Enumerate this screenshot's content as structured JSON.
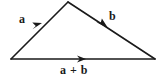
{
  "figure": {
    "name": "vector-addition-triangle",
    "background_color": "#ffffff",
    "stroke_color": "#1a1a1a",
    "labels": {
      "vector_a": "a",
      "vector_b": "b",
      "vector_sum": "a + b"
    }
  },
  "diagram_data": {
    "type": "vector-diagram",
    "description": "Triangle rule for vector addition: vector a from lower-left vertex to apex, vector b from apex to lower-right vertex, resultant a + b along the base from lower-left to lower-right.",
    "vertices": {
      "left": [
        11,
        59
      ],
      "apex": [
        68,
        2
      ],
      "right": [
        155,
        59
      ]
    },
    "vectors": [
      {
        "name": "a",
        "label": "a",
        "from": [
          11,
          59
        ],
        "to": [
          68,
          2
        ],
        "arrowhead_at": [
          38,
          27
        ],
        "label_position": [
          23,
          19
        ]
      },
      {
        "name": "b",
        "label": "b",
        "from": [
          68,
          2
        ],
        "to": [
          155,
          59
        ],
        "arrowhead_at": [
          104,
          25
        ],
        "label_position": [
          113,
          16
        ]
      },
      {
        "name": "a_plus_b",
        "label": "a + b",
        "from": [
          11,
          59
        ],
        "to": [
          155,
          59
        ],
        "arrowhead_at": [
          84,
          59
        ],
        "label_position": [
          78,
          70
        ]
      }
    ],
    "line_width": 1.6,
    "arrow_length": 9,
    "arrow_half_width": 3.2
  }
}
